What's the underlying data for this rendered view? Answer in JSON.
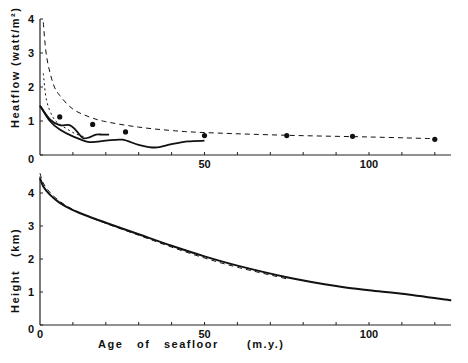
{
  "chart_data": [
    {
      "type": "line",
      "panel": "top",
      "title": "",
      "xlabel": "",
      "ylabel": "Heatflow",
      "ylabel_unit": "(watt/m²)",
      "xlim": [
        0,
        125
      ],
      "ylim": [
        0,
        4
      ],
      "xticks": [
        0,
        50,
        100
      ],
      "xtick_labels": [
        "",
        "50",
        "100"
      ],
      "yticks": [
        0,
        1,
        2,
        3,
        4
      ],
      "ytick_labels": [
        "0",
        "1",
        "2",
        "3",
        "4"
      ],
      "grid": false,
      "series": [
        {
          "name": "model upper (long dashed)",
          "style": "dashed",
          "x": [
            1,
            2,
            4,
            6,
            10,
            15,
            20,
            30,
            40,
            50,
            75,
            100,
            120
          ],
          "y": [
            3.9,
            2.9,
            2.1,
            1.75,
            1.35,
            1.12,
            0.98,
            0.82,
            0.72,
            0.66,
            0.58,
            0.53,
            0.48
          ]
        },
        {
          "name": "model lower (short dashed)",
          "style": "dotted",
          "x": [
            1,
            2,
            4,
            6,
            8,
            10,
            12,
            14
          ],
          "y": [
            2.4,
            1.6,
            1.1,
            0.9,
            0.78,
            0.66,
            0.58,
            0.52
          ]
        },
        {
          "name": "observed mean (solid, lower)",
          "style": "solid",
          "x": [
            0,
            3,
            6,
            10,
            15,
            20,
            25,
            30,
            35,
            40,
            45,
            50
          ],
          "y": [
            1.45,
            1.0,
            0.75,
            0.55,
            0.38,
            0.42,
            0.45,
            0.3,
            0.22,
            0.32,
            0.4,
            0.42
          ]
        },
        {
          "name": "observed (solid, upper)",
          "style": "solid",
          "x": [
            0,
            3,
            6,
            9,
            11,
            13,
            15,
            17,
            19,
            21
          ],
          "y": [
            1.45,
            1.05,
            0.88,
            0.88,
            0.72,
            0.5,
            0.52,
            0.6,
            0.6,
            0.6
          ]
        }
      ],
      "points": {
        "name": "data",
        "x": [
          6,
          16,
          26,
          50,
          75,
          95,
          120
        ],
        "y": [
          1.12,
          0.9,
          0.68,
          0.57,
          0.57,
          0.55,
          0.46
        ]
      }
    },
    {
      "type": "line",
      "panel": "bottom",
      "title": "",
      "xlabel": "Age of seafloor",
      "xlabel_unit": "(m.y.)",
      "ylabel": "Height",
      "ylabel_unit": "(km)",
      "xlim": [
        0,
        125
      ],
      "ylim": [
        0,
        4.6
      ],
      "xticks": [
        0,
        50,
        100
      ],
      "xtick_labels": [
        "0",
        "50",
        "100"
      ],
      "yticks": [
        0,
        1,
        2,
        3,
        4
      ],
      "ytick_labels": [
        "0",
        "1",
        "2",
        "3",
        "4"
      ],
      "grid": false,
      "series": [
        {
          "name": "observed (solid)",
          "style": "solid",
          "x": [
            0,
            1,
            3,
            6,
            10,
            15,
            20,
            30,
            40,
            50,
            60,
            75,
            90,
            100,
            110,
            125
          ],
          "y": [
            4.45,
            4.2,
            3.95,
            3.7,
            3.48,
            3.28,
            3.1,
            2.75,
            2.4,
            2.08,
            1.8,
            1.45,
            1.18,
            1.05,
            0.95,
            0.75
          ]
        },
        {
          "name": "model (dashed)",
          "style": "dashed",
          "x": [
            0,
            1,
            3,
            6,
            10,
            15,
            20,
            30,
            40,
            50,
            60,
            75
          ],
          "y": [
            4.6,
            4.3,
            4.02,
            3.75,
            3.5,
            3.28,
            3.08,
            2.72,
            2.36,
            2.03,
            1.75,
            1.4
          ]
        }
      ]
    }
  ],
  "labels": {
    "top_ylabel": "Heatflow",
    "top_yunit": "(watt/m²)",
    "bottom_ylabel": "Height",
    "bottom_yunit": "(km)",
    "xlabel": "Age   of   seafloor",
    "xunit": "(m.y.)"
  }
}
